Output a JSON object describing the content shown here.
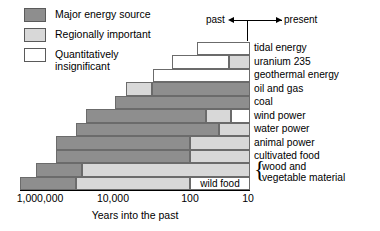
{
  "legend": {
    "items": [
      {
        "key": "major",
        "label": "Major energy source",
        "swatch": "major"
      },
      {
        "key": "regional",
        "label": "Regionally important",
        "swatch": "regional"
      },
      {
        "key": "insig",
        "label": "Quantitatively\ninsignificant",
        "swatch": "insig"
      }
    ]
  },
  "direction": {
    "past_label": "past",
    "present_label": "present"
  },
  "colors": {
    "major": "#8e8e8e",
    "regional": "#d8d8d8",
    "insignificant": "#ffffff",
    "outline": "#6b6b6b"
  },
  "chart_data": {
    "type": "bar",
    "title": "",
    "xlabel": "Years into the past",
    "ylabel": "",
    "orientation": "horizontal-stacked",
    "xscale": "log-reversed",
    "xticks": [
      "1,000,000",
      "10,000",
      "100",
      "10"
    ],
    "xtick_values": [
      1000000,
      10000,
      100,
      10
    ],
    "grid": false,
    "legend_position": "top-left",
    "annotations": [
      "wild food"
    ],
    "categories": [
      "tidal energy",
      "uranium 235",
      "geothermal energy",
      "oil and gas",
      "coal",
      "wind power",
      "water power",
      "animal power",
      "cultivated food",
      "wood and\nvegetable material",
      "wild food"
    ],
    "rows": [
      {
        "label": "tidal energy",
        "segments": [
          {
            "status": "insignificant",
            "from": 40,
            "to": 10
          }
        ]
      },
      {
        "label": "uranium 235",
        "segments": [
          {
            "status": "insignificant",
            "from": 90,
            "to": 20
          },
          {
            "status": "regionally important",
            "from": 20,
            "to": 10
          }
        ]
      },
      {
        "label": "geothermal energy",
        "segments": [
          {
            "status": "insignificant",
            "from": 190,
            "to": 10
          }
        ]
      },
      {
        "label": "oil and gas",
        "segments": [
          {
            "status": "regionally important",
            "from": 300,
            "to": 130
          },
          {
            "status": "major",
            "from": 130,
            "to": 10
          }
        ]
      },
      {
        "label": "coal",
        "segments": [
          {
            "status": "major",
            "from": 600,
            "to": 10
          }
        ]
      },
      {
        "label": "wind power",
        "segments": [
          {
            "status": "major",
            "from": 2000,
            "to": 30
          },
          {
            "status": "regionally important",
            "from": 30,
            "to": 17
          },
          {
            "status": "insignificant",
            "from": 17,
            "to": 10
          }
        ]
      },
      {
        "label": "water power",
        "segments": [
          {
            "status": "major",
            "from": 3000,
            "to": 13
          },
          {
            "status": "regionally important",
            "from": 13,
            "to": 10
          }
        ]
      },
      {
        "label": "animal power",
        "segments": [
          {
            "status": "major",
            "from": 10000,
            "to": 100
          },
          {
            "status": "regionally important",
            "from": 100,
            "to": 10
          }
        ]
      },
      {
        "label": "cultivated food",
        "segments": [
          {
            "status": "major",
            "from": 10000,
            "to": 100
          },
          {
            "status": "regionally important",
            "from": 100,
            "to": 10
          }
        ]
      },
      {
        "label": "wood and vegetable material",
        "segments": [
          {
            "status": "major",
            "from": 100000,
            "to": 10
          }
        ]
      },
      {
        "label": "wild food",
        "segments": [
          {
            "status": "major",
            "from": 1000000,
            "to": 20000
          },
          {
            "status": "regionally important",
            "from": 20000,
            "to": 100
          },
          {
            "status": "insignificant",
            "from": 100,
            "to": 10,
            "text": "wild food"
          }
        ]
      }
    ]
  },
  "layout": {
    "bars": [
      {
        "label": "tidal energy",
        "top": 0.5,
        "left": 197,
        "segs": [
          {
            "s": "insig",
            "x": 197,
            "w": 53
          }
        ]
      },
      {
        "label": "uranium 235",
        "top": 14,
        "left": 172,
        "segs": [
          {
            "s": "insig",
            "x": 172,
            "w": 57
          },
          {
            "s": "regional",
            "x": 229,
            "w": 21
          }
        ]
      },
      {
        "label": "geothermal energy",
        "top": 27.5,
        "left": 153,
        "segs": [
          {
            "s": "insig",
            "x": 153,
            "w": 97
          }
        ]
      },
      {
        "label": "oil and gas",
        "top": 41,
        "left": 126,
        "segs": [
          {
            "s": "regional",
            "x": 126,
            "w": 26
          },
          {
            "s": "major",
            "x": 152,
            "w": 98
          }
        ]
      },
      {
        "label": "coal",
        "top": 54.5,
        "left": 115,
        "segs": [
          {
            "s": "major",
            "x": 115,
            "w": 135
          }
        ]
      },
      {
        "label": "wind power",
        "top": 68,
        "left": 86,
        "segs": [
          {
            "s": "major",
            "x": 86,
            "w": 120
          },
          {
            "s": "regional",
            "x": 206,
            "w": 25
          },
          {
            "s": "insig",
            "x": 231,
            "w": 19
          }
        ]
      },
      {
        "label": "water power",
        "top": 81.5,
        "left": 76,
        "segs": [
          {
            "s": "major",
            "x": 76,
            "w": 143
          },
          {
            "s": "regional",
            "x": 219,
            "w": 31
          }
        ]
      },
      {
        "label": "animal power",
        "top": 95,
        "left": 56,
        "segs": [
          {
            "s": "major",
            "x": 56,
            "w": 134
          },
          {
            "s": "regional",
            "x": 190,
            "w": 60
          }
        ]
      },
      {
        "label": "cultivated food",
        "top": 108.5,
        "left": 56,
        "segs": [
          {
            "s": "major",
            "x": 56,
            "w": 134
          },
          {
            "s": "regional",
            "x": 190,
            "w": 60
          }
        ]
      },
      {
        "label": "wood and vegetable",
        "top": 122,
        "left": 36,
        "segs": [
          {
            "s": "major",
            "x": 36,
            "w": 46
          },
          {
            "s": "regional",
            "x": 82,
            "w": 168
          }
        ]
      },
      {
        "label": "wild food",
        "top": 135.5,
        "left": 20,
        "segs": [
          {
            "s": "major",
            "x": 20,
            "w": 56
          },
          {
            "s": "regional",
            "x": 76,
            "w": 114
          },
          {
            "s": "insig",
            "x": 190,
            "w": 60,
            "t": "wild food"
          }
        ]
      }
    ],
    "xticks": [
      {
        "label": "1,000,000",
        "x": 40
      },
      {
        "label": "10,000",
        "x": 113
      },
      {
        "label": "100",
        "x": 190
      },
      {
        "label": "10",
        "x": 248
      }
    ],
    "rowlabels": [
      {
        "text": "tidal energy",
        "top": 1
      },
      {
        "text": "uranium 235",
        "top": 14.5
      },
      {
        "text": "geothermal energy",
        "top": 28
      },
      {
        "text": "oil and gas",
        "top": 41.5
      },
      {
        "text": "coal",
        "top": 55
      },
      {
        "text": "wind power",
        "top": 68.5
      },
      {
        "text": "water power",
        "top": 82
      },
      {
        "text": "animal power",
        "top": 95.5
      },
      {
        "text": "cultivated food",
        "top": 109
      },
      {
        "text": "wood and\nvegetable material",
        "top": 120,
        "indent": 8,
        "brace": true
      }
    ]
  }
}
